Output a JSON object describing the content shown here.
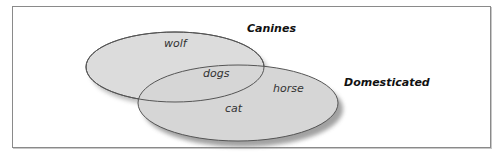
{
  "diagram": {
    "sets": [
      {
        "name": "Canines",
        "members_only": [
          "wolf"
        ]
      },
      {
        "name": "Domesticated",
        "members_only": [
          "horse",
          "cat"
        ]
      }
    ],
    "intersection": [
      "dogs"
    ],
    "labels": {
      "canines": "Canines",
      "domesticated": "Domesticated",
      "wolf": "wolf",
      "dogs": "dogs",
      "horse": "horse",
      "cat": "cat"
    },
    "colors": {
      "fill": "#d9d9d9",
      "stroke": "#555555",
      "shadow": "#9a9a9a"
    }
  }
}
